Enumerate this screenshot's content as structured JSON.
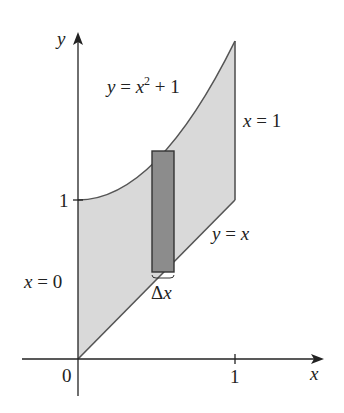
{
  "figure": {
    "colors": {
      "background": "#ffffff",
      "axis": "#222222",
      "region_fill": "#d9d9d9",
      "boundary": "#555555",
      "rectangle_fill": "#8c8c8c",
      "rectangle_stroke": "#333333",
      "text": "#222222"
    },
    "axes": {
      "x_label": "x",
      "y_label": "y",
      "origin_label": "0",
      "x_tick_label": "1",
      "y_tick_label": "1"
    },
    "curves": {
      "upper": {
        "label_lhs": "y",
        "label_eq": " = ",
        "label_var": "x",
        "label_exp": "2",
        "label_rest": " + 1"
      },
      "lower": {
        "label_lhs": "y",
        "label_eq": " = ",
        "label_var": "x"
      },
      "left": {
        "label_var": "x",
        "label_eq": " = ",
        "label_val": "0"
      },
      "right": {
        "label_var": "x",
        "label_eq": " = ",
        "label_val": "1"
      }
    },
    "rectangle": {
      "width_label_symbol": "Δ",
      "width_label_var": "x"
    }
  }
}
